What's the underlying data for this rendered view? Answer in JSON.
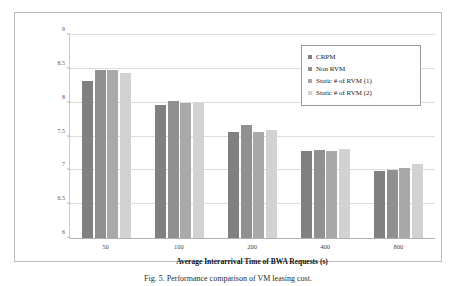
{
  "figure": {
    "caption": "Fig. 5.   Performance comparison of VM leasing cost."
  },
  "axes": {
    "ylabel": "VM Leasing Cost (log(RC))",
    "xlabel": "Average Interarrival Time of BWA Requests (s)",
    "yticks": [
      "6",
      "6.5",
      "7",
      "7.5",
      "8",
      "8.5",
      "9"
    ],
    "xticks": [
      "50",
      "100",
      "200",
      "400",
      "800"
    ]
  },
  "legend": {
    "items": [
      {
        "label": "CRPM",
        "color": "#808080"
      },
      {
        "label": "Non RVM",
        "color": "#909090"
      },
      {
        "label": "Static # of RVM (1)",
        "color": "#a9a9a9"
      },
      {
        "label": "Static # of RVM (2)",
        "color": "#d2d2d2"
      }
    ]
  },
  "chart_data": {
    "type": "bar",
    "title": "",
    "xlabel": "Average Interarrival Time of BWA Requests (s)",
    "ylabel": "VM Leasing Cost (log(RC))",
    "categories": [
      "50",
      "100",
      "200",
      "400",
      "800"
    ],
    "ylim": [
      6,
      9
    ],
    "yticks": [
      6,
      6.5,
      7,
      7.5,
      8,
      8.5,
      9
    ],
    "grid": true,
    "legend_position": "upper right",
    "series": [
      {
        "name": "CRPM",
        "color": "#808080",
        "values": [
          8.32,
          7.96,
          7.57,
          7.28,
          6.99
        ]
      },
      {
        "name": "Non RVM",
        "color": "#909090",
        "values": [
          8.49,
          8.02,
          7.67,
          7.3,
          7.0
        ]
      },
      {
        "name": "Static # of RVM (1)",
        "color": "#a9a9a9",
        "values": [
          8.48,
          7.99,
          7.57,
          7.28,
          7.03
        ]
      },
      {
        "name": "Static # of RVM (2)",
        "color": "#d2d2d2",
        "values": [
          8.44,
          7.99,
          7.59,
          7.31,
          7.09
        ]
      }
    ]
  }
}
